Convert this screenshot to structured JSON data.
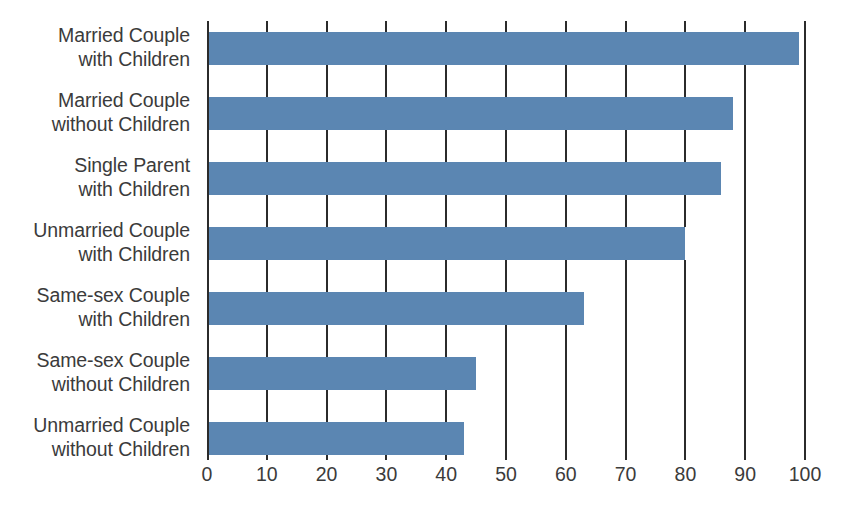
{
  "chart_data": {
    "type": "bar",
    "orientation": "horizontal",
    "title": "",
    "subtitle": "",
    "xlabel": "",
    "ylabel": "",
    "categories": [
      "Married Couple\nwith Children",
      "Married Couple\nwithout Children",
      "Single Parent\nwith Children",
      "Unmarried Couple\nwith Children",
      "Same-sex Couple\nwith Children",
      "Same-sex Couple\nwithout Children",
      "Unmarried Couple\nwithout Children"
    ],
    "values": [
      99,
      88,
      86,
      80,
      63,
      45,
      43
    ],
    "xlim": [
      0,
      100
    ],
    "xticks": [
      0,
      10,
      20,
      30,
      40,
      50,
      60,
      70,
      80,
      90,
      100
    ],
    "xtick_labels": [
      "0",
      "10",
      "20",
      "30",
      "40",
      "50",
      "60",
      "70",
      "80",
      "90",
      "100"
    ],
    "grid": true,
    "grid_axis": "x",
    "legend": false,
    "legend_position": "none",
    "bar_color": "#5b86b2",
    "axis_color": "#2b2b2b",
    "label_color": "#3b3b3b",
    "background": "#ffffff"
  }
}
